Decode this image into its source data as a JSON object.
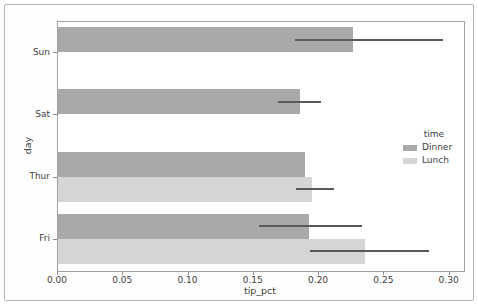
{
  "chart_data": {
    "type": "bar",
    "orientation": "horizontal",
    "title": "",
    "xlabel": "tip_pct",
    "ylabel": "day",
    "categories": [
      "Sun",
      "Sat",
      "Thur",
      "Fri"
    ],
    "x_ticks": [
      "0.00",
      "0.05",
      "0.10",
      "0.15",
      "0.20",
      "0.25",
      "0.30"
    ],
    "x_tick_values": [
      0,
      0.05,
      0.1,
      0.15,
      0.2,
      0.25,
      0.3
    ],
    "xlim": [
      0,
      0.311
    ],
    "grid": "off",
    "series": [
      {
        "name": "Dinner",
        "color": "#a9a9a9",
        "values": [
          0.227,
          0.186,
          0.19,
          0.193
        ],
        "ci_low": [
          0.182,
          0.169,
          null,
          0.155
        ],
        "ci_high": [
          0.296,
          0.202,
          null,
          0.234
        ]
      },
      {
        "name": "Lunch",
        "color": "#d5d5d5",
        "values": [
          null,
          null,
          0.195,
          0.236
        ],
        "ci_low": [
          null,
          null,
          0.183,
          0.194
        ],
        "ci_high": [
          null,
          null,
          0.212,
          0.285
        ]
      }
    ],
    "error_bar_color": "#5a5a5a",
    "legend": {
      "title": "time",
      "position": "center-right",
      "entries": [
        {
          "label": "Dinner",
          "color": "#a9a9a9"
        },
        {
          "label": "Lunch",
          "color": "#d5d5d5"
        }
      ]
    }
  }
}
